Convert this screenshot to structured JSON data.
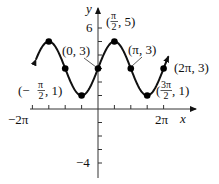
{
  "chart_data": {
    "type": "line",
    "title": "",
    "function": "y = 3 + 2 sin(x)",
    "xlabel": "x",
    "ylabel": "y",
    "xlim": [
      -6.2832,
      6.2832
    ],
    "ylim": [
      -4,
      6
    ],
    "x_tick_labels": [
      "-2π",
      "2π"
    ],
    "x_tick_step": "π/2",
    "y_tick_labels": [
      "6",
      "-4"
    ],
    "y_tick_step": 1,
    "grid": false,
    "series": [
      {
        "name": "y = 3 + 2 sin x",
        "x_range": [
          -6.2832,
          6.7
        ],
        "arrows": "both ends"
      }
    ],
    "points": [
      {
        "x": -4.7124,
        "y": 5,
        "label": ""
      },
      {
        "x": -3.1416,
        "y": 3,
        "label": ""
      },
      {
        "x": -1.5708,
        "y": 1,
        "label": "(-π/2, 1)"
      },
      {
        "x": 0,
        "y": 3,
        "label": "(0, 3)"
      },
      {
        "x": 1.5708,
        "y": 5,
        "label": "(π/2, 5)"
      },
      {
        "x": 3.1416,
        "y": 3,
        "label": "(π, 3)"
      },
      {
        "x": 4.7124,
        "y": 1,
        "label": "(3π/2, 1)"
      },
      {
        "x": 6.2832,
        "y": 3,
        "label": "(2π, 3)"
      }
    ]
  },
  "labels": {
    "y_axis": "y",
    "x_axis": "x",
    "y6": "6",
    "yneg4": "−4",
    "xneg2pi": "−2π",
    "x2pi": "2π",
    "p_0_3": "(0, 3)",
    "p_pi_3": "(π, 3)",
    "p_2pi_3": "(2π, 3)",
    "pi": "π",
    "three_pi": "3π",
    "two": "2",
    "five_tail": ", 5)",
    "one_tail": ", 1)",
    "open_paren": "(",
    "open_paren_neg": "(−"
  }
}
